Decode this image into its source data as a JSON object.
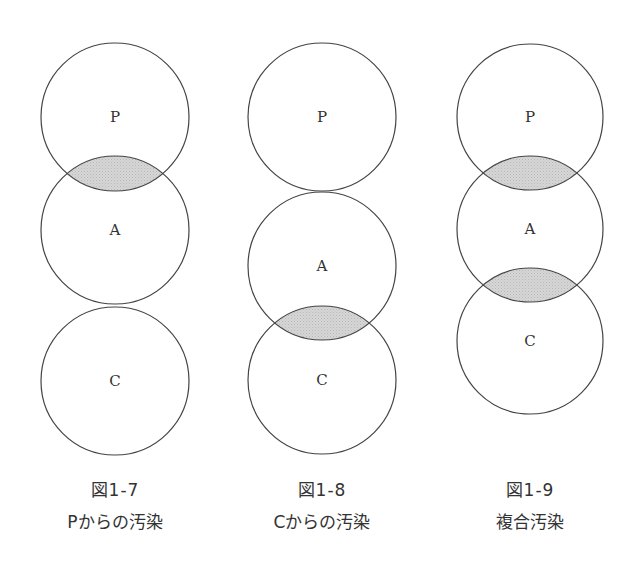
{
  "colors": {
    "stroke": "#444444",
    "shade": "#d4d4d4",
    "text": "#333333"
  },
  "figures": [
    {
      "number": "図1-7",
      "caption": "Pからの汚染",
      "circles": [
        {
          "label": "P",
          "cx": 115,
          "cy": 117,
          "r": 74
        },
        {
          "label": "A",
          "cx": 115,
          "cy": 230,
          "r": 74
        },
        {
          "label": "C",
          "cx": 115,
          "cy": 381,
          "r": 74
        }
      ],
      "shaded_overlaps": [
        [
          "P",
          "A"
        ]
      ]
    },
    {
      "number": "図1-8",
      "caption": "Cからの汚染",
      "circles": [
        {
          "label": "P",
          "cx": 322,
          "cy": 117,
          "r": 74
        },
        {
          "label": "A",
          "cx": 322,
          "cy": 266,
          "r": 74
        },
        {
          "label": "C",
          "cx": 322,
          "cy": 380,
          "r": 74
        }
      ],
      "shaded_overlaps": [
        [
          "A",
          "C"
        ]
      ]
    },
    {
      "number": "図1-9",
      "caption": "複合汚染",
      "circles": [
        {
          "label": "P",
          "cx": 530,
          "cy": 117,
          "r": 73
        },
        {
          "label": "A",
          "cx": 530,
          "cy": 229,
          "r": 73
        },
        {
          "label": "C",
          "cx": 530,
          "cy": 341,
          "r": 73
        }
      ],
      "shaded_overlaps": [
        [
          "P",
          "A"
        ],
        [
          "A",
          "C"
        ]
      ]
    }
  ]
}
